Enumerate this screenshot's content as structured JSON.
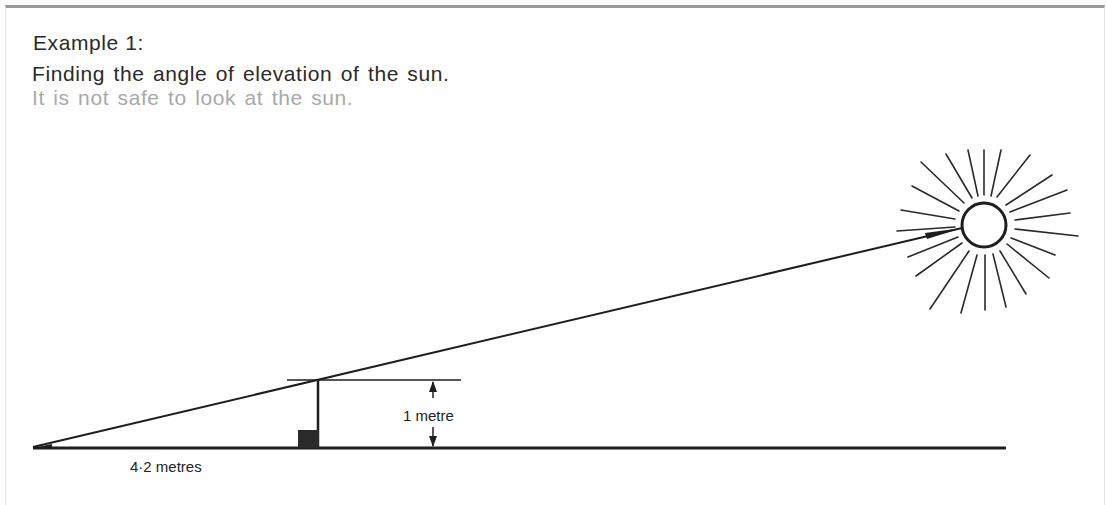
{
  "text": {
    "heading": "Example 1:",
    "subtitle": "Finding the angle of elevation of the sun.",
    "warning": "It is not safe to look at the sun."
  },
  "diagram": {
    "labels": {
      "stick_height": "1 metre",
      "shadow_length": "4·2 metres"
    },
    "elements": {
      "sun": "sun-icon",
      "stick": "vertical-stick",
      "block": "stick-base-block",
      "ground": "ground-line",
      "sun_ray_line": "line-to-sun",
      "height_arrow": "double-arrow"
    },
    "colors": {
      "ink": "#1e1e1e",
      "warning_text": "#a8a8a8",
      "frame": "#9a9a9a"
    }
  }
}
